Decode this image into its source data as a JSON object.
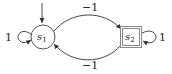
{
  "diagram": {
    "type": "state-machine",
    "colors": {
      "stroke": "#333333",
      "accepting_border": "#888888",
      "text": "#222222"
    },
    "states": [
      {
        "id": "s1",
        "label_base": "s",
        "label_sub": "1",
        "shape": "circle",
        "initial": true
      },
      {
        "id": "s2",
        "label_base": "s",
        "label_sub": "2",
        "shape": "double-square",
        "accepting": true
      }
    ],
    "transitions": [
      {
        "from": "s1",
        "to": "s1",
        "label": "1",
        "kind": "self-loop-left"
      },
      {
        "from": "s1",
        "to": "s2",
        "label": "−1",
        "kind": "curve-top"
      },
      {
        "from": "s2",
        "to": "s1",
        "label": "−1",
        "kind": "curve-bottom"
      },
      {
        "from": "s2",
        "to": "s2",
        "label": "1",
        "kind": "self-loop-right"
      }
    ]
  }
}
